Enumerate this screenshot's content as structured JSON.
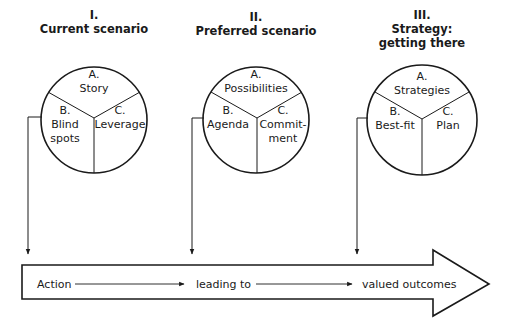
{
  "stages": [
    {
      "numeral": "I.",
      "title_lines": [
        "Current scenario"
      ],
      "segments": {
        "a": {
          "letter": "A.",
          "lines": [
            "Story"
          ]
        },
        "b": {
          "letter": "B.",
          "lines": [
            "Blind",
            "spots"
          ]
        },
        "c": {
          "letter": "C.",
          "lines": [
            "Leverage"
          ]
        }
      }
    },
    {
      "numeral": "II.",
      "title_lines": [
        "Preferred scenario"
      ],
      "segments": {
        "a": {
          "letter": "A.",
          "lines": [
            "Possibilities"
          ]
        },
        "b": {
          "letter": "B.",
          "lines": [
            "Agenda"
          ]
        },
        "c": {
          "letter": "C.",
          "lines": [
            "Commit-",
            "ment"
          ]
        }
      }
    },
    {
      "numeral": "III.",
      "title_lines": [
        "Strategy:",
        "getting there"
      ],
      "segments": {
        "a": {
          "letter": "A.",
          "lines": [
            "Strategies"
          ]
        },
        "b": {
          "letter": "B.",
          "lines": [
            "Best-fit"
          ]
        },
        "c": {
          "letter": "C.",
          "lines": [
            "Plan"
          ]
        }
      }
    }
  ],
  "flow": {
    "steps": [
      "Action",
      "leading to",
      "valued outcomes"
    ]
  },
  "colors": {
    "ink": "#1a1a1a",
    "background": "#ffffff"
  }
}
